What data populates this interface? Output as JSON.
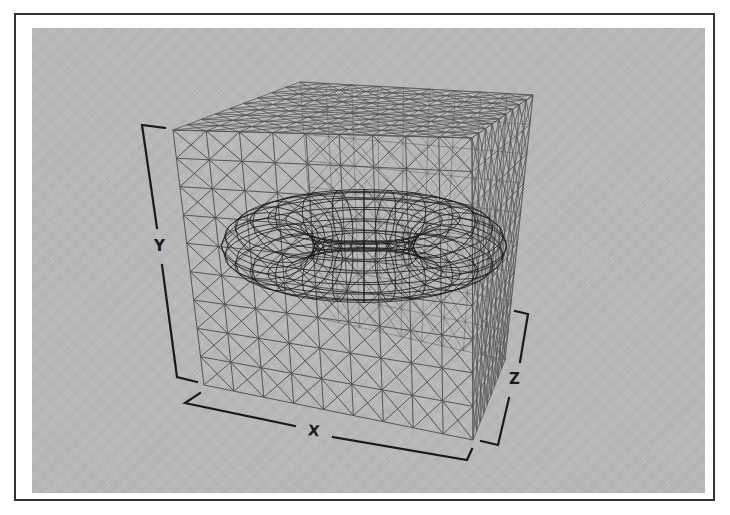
{
  "figure": {
    "colors": {
      "frame_border": "#333333",
      "panel_background": "#b9b9b9",
      "cube_wire": "#555555",
      "torus_wire": "#1a1a1a",
      "axis_bracket": "#1a1a1a"
    }
  },
  "axes": {
    "x": {
      "label": "X"
    },
    "y": {
      "label": "Y"
    },
    "z": {
      "label": "Z"
    }
  },
  "objects": {
    "cube": {
      "name": "wireframe cube",
      "grid_divisions": 9
    },
    "torus": {
      "name": "wireframe torus",
      "rings": 28,
      "segments": 16
    }
  }
}
